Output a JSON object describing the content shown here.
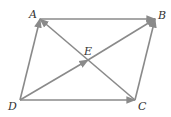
{
  "diagram": {
    "type": "parallelogram-vectors",
    "stroke_color": "#8a8a8a",
    "label_color": "#333333",
    "points": {
      "A": {
        "label": "A",
        "x": 40,
        "y": 19
      },
      "B": {
        "label": "B",
        "x": 155,
        "y": 19
      },
      "C": {
        "label": "C",
        "x": 135,
        "y": 100
      },
      "D": {
        "label": "D",
        "x": 20,
        "y": 100
      },
      "E": {
        "label": "E",
        "x": 88,
        "y": 60
      }
    },
    "vectors": [
      {
        "from": "D",
        "to": "A"
      },
      {
        "from": "A",
        "to": "B"
      },
      {
        "from": "D",
        "to": "C"
      },
      {
        "from": "C",
        "to": "B"
      },
      {
        "from": "D",
        "to": "E"
      },
      {
        "from": "E",
        "to": "B"
      },
      {
        "from": "C",
        "to": "A"
      }
    ]
  }
}
